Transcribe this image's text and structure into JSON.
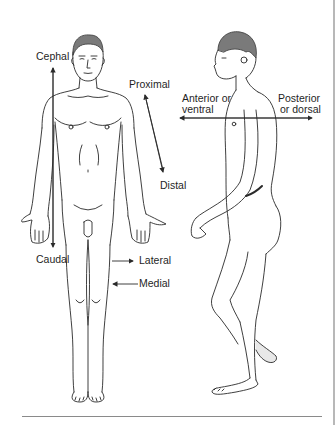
{
  "figure": {
    "type": "anatomical-directional-terms-diagram",
    "views": [
      {
        "name": "anterior view",
        "orientation": "front"
      },
      {
        "name": "lateral view",
        "orientation": "side (facing left)"
      }
    ],
    "labels": {
      "cephal": "Cephal",
      "caudal": "Caudal",
      "proximal": "Proximal",
      "distal": "Distal",
      "lateral": "Lateral",
      "medial": "Medial",
      "anterior_line1": "Anterior or",
      "anterior_line2": "ventral",
      "posterior_line1": "Posterior",
      "posterior_line2": "or dorsal"
    },
    "colors": {
      "background": "#ffffff",
      "line": "#2a2a2a",
      "text": "#1f1f1f",
      "rule": "#8a8a8a"
    }
  }
}
